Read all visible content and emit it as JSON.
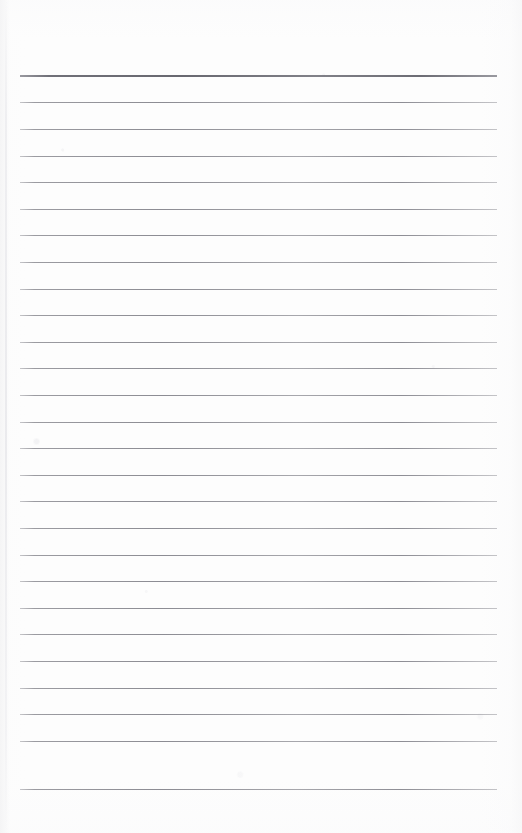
{
  "document": {
    "kind": "lined-notebook-paper-scan",
    "title": "Blank ruled paper",
    "page_width": 522,
    "page_height": 833,
    "background_color": "#fdfdfd",
    "rule_color": "#8e8e95",
    "header_rule_color": "#6e6e76",
    "rule_left": 20,
    "rule_right": 497,
    "rule_spacing": 26.6,
    "first_rule_y": 76,
    "rule_count": 27,
    "written_text": "",
    "rules": [
      {
        "index": 1,
        "y": 76,
        "weight": "header"
      },
      {
        "index": 2,
        "y": 102,
        "weight": "normal"
      },
      {
        "index": 3,
        "y": 129,
        "weight": "normal"
      },
      {
        "index": 4,
        "y": 156,
        "weight": "normal"
      },
      {
        "index": 5,
        "y": 182,
        "weight": "normal"
      },
      {
        "index": 6,
        "y": 209,
        "weight": "normal"
      },
      {
        "index": 7,
        "y": 235,
        "weight": "normal"
      },
      {
        "index": 8,
        "y": 262,
        "weight": "normal"
      },
      {
        "index": 9,
        "y": 289,
        "weight": "normal"
      },
      {
        "index": 10,
        "y": 315,
        "weight": "normal"
      },
      {
        "index": 11,
        "y": 342,
        "weight": "normal"
      },
      {
        "index": 12,
        "y": 368,
        "weight": "normal"
      },
      {
        "index": 13,
        "y": 395,
        "weight": "normal"
      },
      {
        "index": 14,
        "y": 422,
        "weight": "normal"
      },
      {
        "index": 15,
        "y": 448,
        "weight": "normal"
      },
      {
        "index": 16,
        "y": 475,
        "weight": "normal"
      },
      {
        "index": 17,
        "y": 501,
        "weight": "normal"
      },
      {
        "index": 18,
        "y": 528,
        "weight": "normal"
      },
      {
        "index": 19,
        "y": 555,
        "weight": "normal"
      },
      {
        "index": 20,
        "y": 581,
        "weight": "normal"
      },
      {
        "index": 21,
        "y": 608,
        "weight": "normal"
      },
      {
        "index": 22,
        "y": 634,
        "weight": "normal"
      },
      {
        "index": 23,
        "y": 661,
        "weight": "normal"
      },
      {
        "index": 24,
        "y": 688,
        "weight": "normal"
      },
      {
        "index": 25,
        "y": 714,
        "weight": "normal"
      },
      {
        "index": 26,
        "y": 741,
        "weight": "normal"
      },
      {
        "index": 27,
        "y": 789,
        "weight": "normal"
      }
    ]
  }
}
